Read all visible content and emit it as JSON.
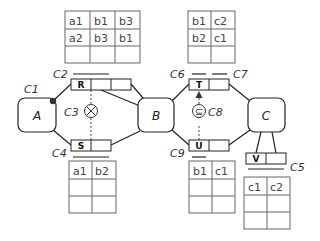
{
  "entities": [
    {
      "id": "A",
      "label": "A"
    },
    {
      "id": "B",
      "label": "B"
    },
    {
      "id": "C",
      "label": "C"
    }
  ],
  "relations": [
    {
      "id": "R",
      "label": "R",
      "cells": 3
    },
    {
      "id": "S",
      "label": "S",
      "cells": 2
    },
    {
      "id": "T",
      "label": "T",
      "cells": 2
    },
    {
      "id": "U",
      "label": "U",
      "cells": 2
    },
    {
      "id": "V",
      "label": "V",
      "cells": 2
    }
  ],
  "constraints": {
    "c1": "C1",
    "c2": "C2",
    "c3": "C3",
    "c4": "C4",
    "c5": "C5",
    "c6": "C6",
    "c7": "C7",
    "c8": "C8",
    "c9": "C9"
  },
  "symbols": {
    "exclusion": "⊗",
    "subset": "⊆"
  },
  "tables": {
    "R_population": {
      "rows": [
        [
          "a1",
          "b1",
          "b3"
        ],
        [
          "a2",
          "b3",
          "b1"
        ],
        [
          "",
          "",
          ""
        ]
      ]
    },
    "T_population": {
      "rows": [
        [
          "b1",
          "c2"
        ],
        [
          "b2",
          "c1"
        ],
        [
          "",
          ""
        ]
      ]
    },
    "S_population": {
      "rows": [
        [
          "a1",
          "b2"
        ],
        [
          "",
          ""
        ],
        [
          "",
          ""
        ]
      ]
    },
    "U_population": {
      "rows": [
        [
          "b1",
          "c1"
        ],
        [
          "",
          ""
        ],
        [
          "",
          ""
        ]
      ]
    },
    "V_population": {
      "rows": [
        [
          "c1",
          "c2"
        ],
        [
          "",
          ""
        ],
        [
          "",
          ""
        ]
      ]
    }
  }
}
